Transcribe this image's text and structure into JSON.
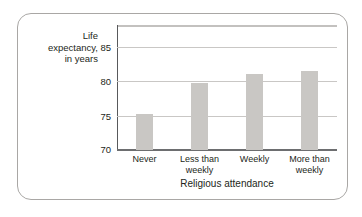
{
  "figure": {
    "frame_border_color": "#a9a7a5",
    "background": "#ffffff"
  },
  "chart_data": {
    "type": "bar",
    "title": "",
    "categories": [
      "Never",
      "Less than weekly",
      "Weekly",
      "More than weekly"
    ],
    "category_lines": [
      [
        "Never"
      ],
      [
        "Less than",
        "weekly"
      ],
      [
        "Weekly"
      ],
      [
        "More than",
        "weekly"
      ]
    ],
    "values": [
      75.3,
      79.8,
      81.0,
      81.5
    ],
    "xlabel": "Religious attendance",
    "ylabel": "Life expectancy, in years",
    "ylabel_lines": [
      "Life",
      "expectancy,",
      "in years"
    ],
    "ylim": [
      70,
      88.2
    ],
    "yticks": [
      70,
      75,
      80,
      85
    ],
    "ytick_labels": [
      "70",
      "75",
      "80",
      "85"
    ],
    "grid": true,
    "gridlines_at": [
      75,
      80,
      85
    ],
    "legend": null,
    "bar_color": "#c9c7c4",
    "axis_color": "#58595b",
    "grid_color": "#c9c7c5"
  }
}
